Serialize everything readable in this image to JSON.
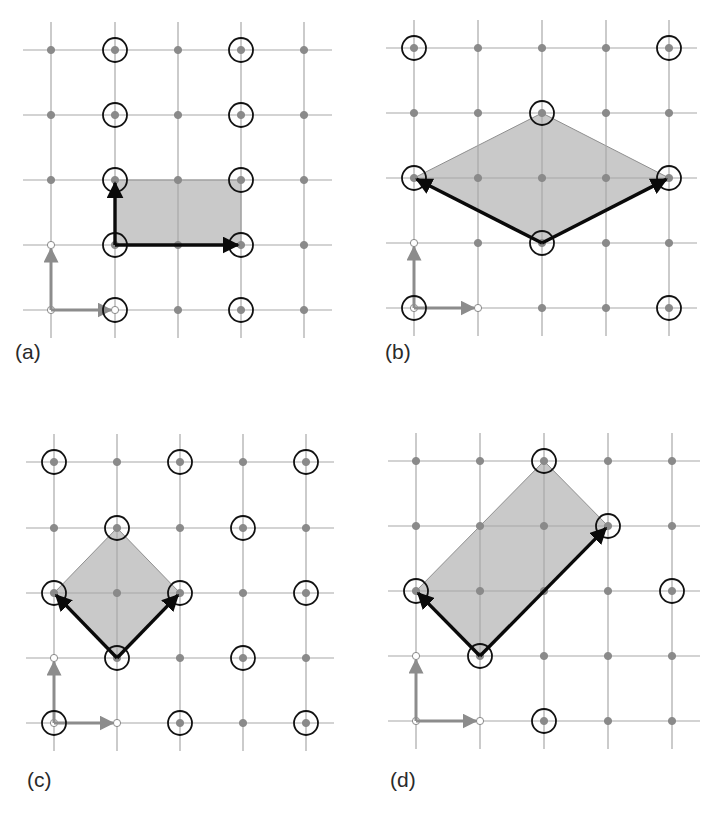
{
  "figure": {
    "colors": {
      "grid_line": "#a8a8a8",
      "lattice_dot": "#8a8a8a",
      "circle": "#111111",
      "basis_arrow": "#8c8c8c",
      "cell_fill": "#c9c9c9",
      "cell_edge": "#8f8f8f",
      "vector_arrow": "#0a0a0a"
    },
    "panels": [
      {
        "id": "a",
        "label": "(a)",
        "label_pos": [
          15,
          340
        ],
        "xs": [
          51,
          115,
          178,
          241,
          304
        ],
        "ys": [
          50,
          115,
          180,
          245,
          310
        ],
        "circled": [
          [
            1,
            0
          ],
          [
            3,
            0
          ],
          [
            1,
            1
          ],
          [
            3,
            1
          ],
          [
            1,
            2
          ],
          [
            3,
            2
          ],
          [
            1,
            3
          ],
          [
            3,
            3
          ],
          [
            1,
            4
          ],
          [
            3,
            4
          ]
        ],
        "cell": [
          [
            1,
            3
          ],
          [
            3,
            3
          ],
          [
            3,
            2
          ],
          [
            1,
            2
          ]
        ],
        "vectors": [
          [
            [
              1,
              3
            ],
            [
              3,
              3
            ]
          ],
          [
            [
              1,
              3
            ],
            [
              1,
              2
            ]
          ]
        ]
      },
      {
        "id": "b",
        "label": "(b)",
        "label_pos": [
          385,
          340
        ],
        "xs": [
          414,
          478,
          542,
          606,
          669
        ],
        "ys": [
          48,
          113,
          178,
          243,
          308
        ],
        "circled": [
          [
            0,
            0
          ],
          [
            4,
            0
          ],
          [
            2,
            1
          ],
          [
            0,
            2
          ],
          [
            4,
            2
          ],
          [
            2,
            3
          ],
          [
            0,
            4
          ],
          [
            4,
            4
          ]
        ],
        "cell": [
          [
            2,
            3
          ],
          [
            4,
            2
          ],
          [
            2,
            1
          ],
          [
            0,
            2
          ]
        ],
        "vectors": [
          [
            [
              2,
              3
            ],
            [
              4,
              2
            ]
          ],
          [
            [
              2,
              3
            ],
            [
              0,
              2
            ]
          ]
        ]
      },
      {
        "id": "c",
        "label": "(c)",
        "label_pos": [
          27,
          768
        ],
        "xs": [
          54,
          117,
          180,
          243,
          306
        ],
        "ys": [
          462,
          528,
          593,
          658,
          723
        ],
        "circled": [
          [
            0,
            0
          ],
          [
            2,
            0
          ],
          [
            4,
            0
          ],
          [
            1,
            1
          ],
          [
            3,
            1
          ],
          [
            0,
            2
          ],
          [
            2,
            2
          ],
          [
            4,
            2
          ],
          [
            1,
            3
          ],
          [
            3,
            3
          ],
          [
            0,
            4
          ],
          [
            2,
            4
          ],
          [
            4,
            4
          ]
        ],
        "cell": [
          [
            1,
            3
          ],
          [
            2,
            2
          ],
          [
            1,
            1
          ],
          [
            0,
            2
          ]
        ],
        "vectors": [
          [
            [
              1,
              3
            ],
            [
              2,
              2
            ]
          ],
          [
            [
              1,
              3
            ],
            [
              0,
              2
            ]
          ]
        ]
      },
      {
        "id": "d",
        "label": "(d)",
        "label_pos": [
          390,
          768
        ],
        "xs": [
          416,
          480,
          544,
          608,
          672
        ],
        "ys": [
          461,
          526,
          591,
          656,
          721
        ],
        "circled": [
          [
            2,
            0
          ],
          [
            3,
            1
          ],
          [
            0,
            2
          ],
          [
            4,
            2
          ],
          [
            1,
            3
          ],
          [
            2,
            4
          ]
        ],
        "cell": [
          [
            1,
            3
          ],
          [
            3,
            1
          ],
          [
            2,
            0
          ],
          [
            0,
            2
          ]
        ],
        "vectors": [
          [
            [
              1,
              3
            ],
            [
              3,
              1
            ]
          ],
          [
            [
              1,
              3
            ],
            [
              0,
              2
            ]
          ]
        ]
      }
    ]
  }
}
